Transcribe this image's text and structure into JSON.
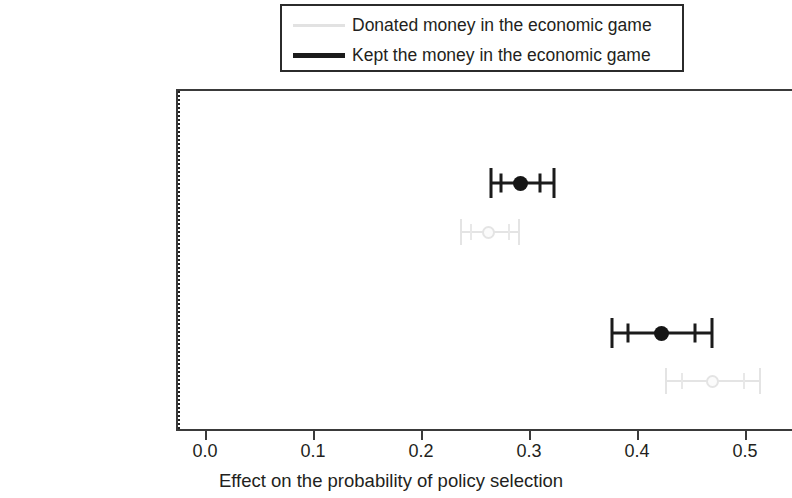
{
  "legend": {
    "items": [
      {
        "label": "Donated money in the economic game",
        "style": "donated",
        "color": "#e2e2e2"
      },
      {
        "label": "Kept the money in the economic game",
        "style": "kept",
        "color": "#1b1b1b"
      }
    ]
  },
  "axis": {
    "x_label": "Effect on the probability of policy selection",
    "x_ticks": [
      "0.0",
      "0.1",
      "0.2",
      "0.3",
      "0.4",
      "0.5"
    ],
    "x_tick_values": [
      0.0,
      0.1,
      0.2,
      0.3,
      0.4,
      0.5
    ],
    "y_categories": [
      "Self-interest",
      "Collective interests"
    ]
  },
  "chart_data": {
    "type": "scatter",
    "subtype": "forest-plot-coefficient-estimates",
    "title": "",
    "xlabel": "Effect on the probability of policy selection",
    "ylabel": "",
    "xlim": [
      0.0,
      0.535
    ],
    "ylim_categories": [
      "Self-interest",
      "Collective interests"
    ],
    "grid": false,
    "legend_position": "top-center",
    "reference_line": {
      "value": 0.0,
      "style": "dotted",
      "color": "#1d1d1d"
    },
    "categories": [
      "Self-interest",
      "Collective interests"
    ],
    "series": [
      {
        "name": "Kept the money in the economic game",
        "color": "#1b1b1b",
        "values": [
          0.29,
          0.421
        ],
        "ci_outer_low": [
          0.263,
          0.375
        ],
        "ci_outer_high": [
          0.321,
          0.468
        ],
        "ci_inner_low": [
          0.272,
          0.39
        ],
        "ci_inner_high": [
          0.308,
          0.452
        ]
      },
      {
        "name": "Donated money in the economic game",
        "color": "#e2e2e2",
        "values": [
          0.261,
          0.468
        ],
        "ci_outer_low": [
          0.235,
          0.425
        ],
        "ci_outer_high": [
          0.289,
          0.512
        ],
        "ci_inner_low": [
          0.244,
          0.44
        ],
        "ci_inner_high": [
          0.28,
          0.497
        ]
      }
    ]
  }
}
